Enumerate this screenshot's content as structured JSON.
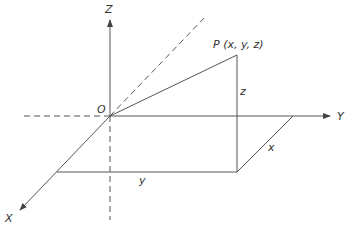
{
  "diagram": {
    "type": "3d-coordinate-axes",
    "axes": {
      "x_label": "X",
      "y_label": "Y",
      "z_label": "Z"
    },
    "origin_label": "O",
    "point_label": "P (x, y, z)",
    "segment_labels": {
      "z": "z",
      "x": "x",
      "y": "y"
    },
    "colors": {
      "line": "#555555",
      "text": "#333333",
      "background": "#ffffff"
    }
  }
}
